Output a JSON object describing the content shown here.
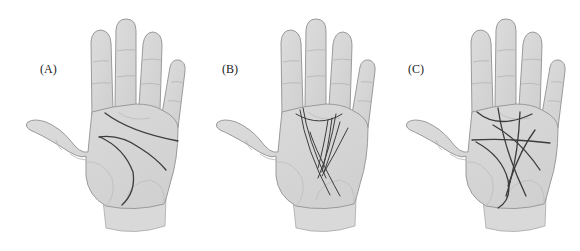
{
  "figure": {
    "panels": [
      {
        "id": "A",
        "label": "(A)",
        "description": "Hand with clear, distinct principal palm lines"
      },
      {
        "id": "B",
        "label": "(B)",
        "description": "Hand with many fine, clustered vertical lines"
      },
      {
        "id": "C",
        "label": "(C)",
        "description": "Hand with many crossing, intersecting lines"
      }
    ],
    "colors": {
      "skin": "#d6d6d6",
      "outline": "#9a9a9a",
      "palm_line": "#3c3c3c",
      "background": "#ffffff"
    }
  }
}
